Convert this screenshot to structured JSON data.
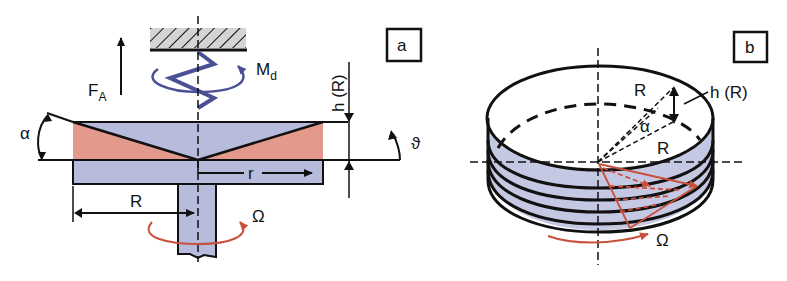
{
  "figure": {
    "panel_a": {
      "tag": "a",
      "labels": {
        "force": "F",
        "force_sub": "A",
        "torque": "M",
        "torque_sub": "d",
        "gap_height": "h (R)",
        "angle_alpha": "α",
        "angle_theta": "ϑ",
        "radius_var": "r",
        "radius": "R",
        "angular_velocity": "Ω"
      }
    },
    "panel_b": {
      "tag": "b",
      "labels": {
        "radius_top": "R",
        "radius_bottom": "R",
        "gap_height": "h (R)",
        "angle_alpha": "α",
        "angular_velocity": "Ω"
      }
    },
    "colors": {
      "plate_blue": "#b7bcdc",
      "fluid_salmon": "#e39a8c",
      "spring_blue": "#4a4f96",
      "rotation_red": "#c8503c",
      "hatch_gray": "#d4d4d4",
      "line": "#111111"
    }
  }
}
